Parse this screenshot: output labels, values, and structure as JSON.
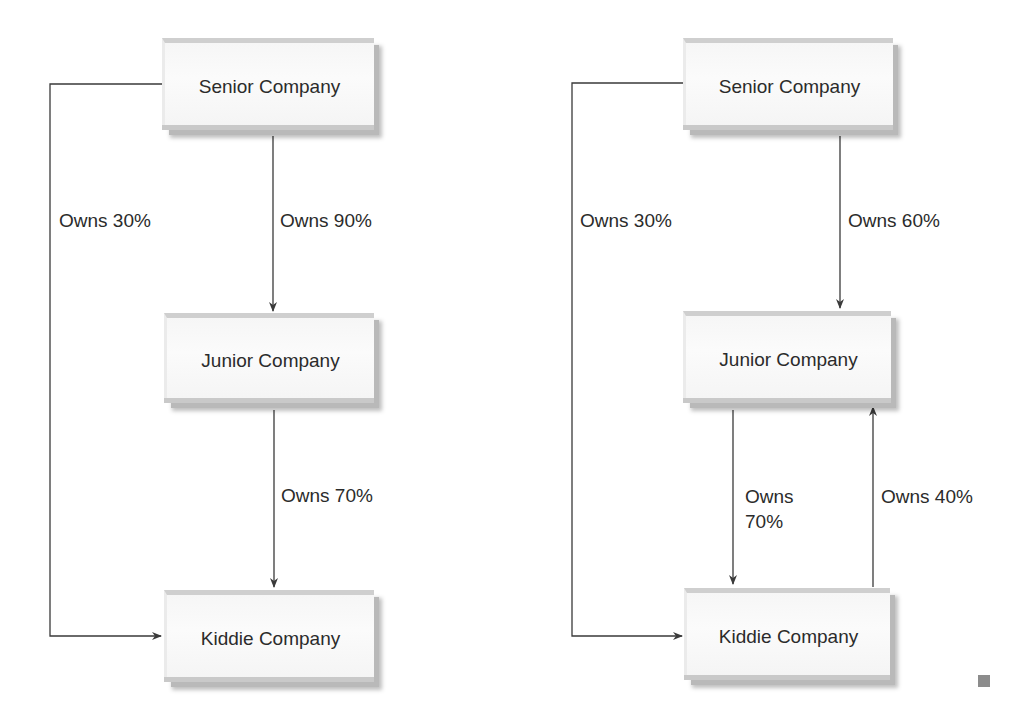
{
  "diagrams": [
    {
      "id": "left",
      "nodes": {
        "senior": "Senior Company",
        "junior": "Junior Company",
        "kiddie": "Kiddie Company"
      },
      "edges": {
        "senior_to_kiddie": "Owns 30%",
        "senior_to_junior": "Owns 90%",
        "junior_to_kiddie": "Owns 70%"
      }
    },
    {
      "id": "right",
      "nodes": {
        "senior": "Senior Company",
        "junior": "Junior Company",
        "kiddie": "Kiddie Company"
      },
      "edges": {
        "senior_to_kiddie": "Owns 30%",
        "senior_to_junior": "Owns 60%",
        "junior_to_kiddie_line1": "Owns",
        "junior_to_kiddie_line2": "70%",
        "kiddie_to_junior": "Owns 40%"
      }
    }
  ],
  "colors": {
    "line": "#3a3a3a",
    "box_face": "#f7f7f7",
    "box_shadow": "#b9b9b9",
    "end_marker": "#8c8c8c"
  }
}
